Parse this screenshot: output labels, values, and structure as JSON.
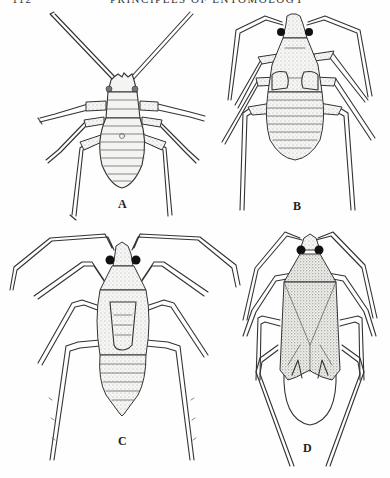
{
  "page": {
    "header": {
      "page_number": "112",
      "running_title": "PRINCIPLES OF ENTOMOLOGY"
    },
    "background": "#fefefe",
    "ink_color": "#333333"
  },
  "figures": [
    {
      "id": "A",
      "label": "A",
      "description": "Early nymph, long antennae, segmented abdomen, no wing pads",
      "label_pos": [
        118,
        199
      ]
    },
    {
      "id": "B",
      "label": "B",
      "description": "Nymph with small wing pads, stippled body, dark eyes",
      "label_pos": [
        293,
        197
      ]
    },
    {
      "id": "C",
      "label": "C",
      "description": "Later nymph with enlarged wing pads, spiny legs, dark eyes",
      "label_pos": [
        118,
        434
      ]
    },
    {
      "id": "D",
      "label": "D",
      "description": "Adult with folded wings over abdomen, long hind legs",
      "label_pos": [
        303,
        437
      ]
    }
  ]
}
